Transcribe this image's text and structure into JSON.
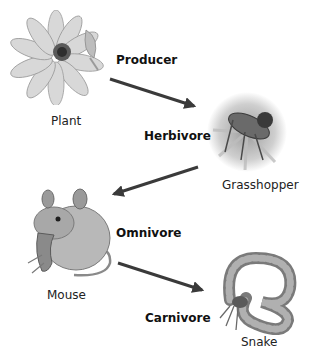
{
  "diagram": {
    "type": "food-chain",
    "nodes": [
      {
        "organism": "Plant",
        "role": "Producer",
        "icon": "flower-icon"
      },
      {
        "organism": "Grasshopper",
        "role": "Herbivore",
        "icon": "grasshopper-icon"
      },
      {
        "organism": "Mouse",
        "role": "Omnivore",
        "icon": "mouse-icon"
      },
      {
        "organism": "Snake",
        "role": "Carnivore",
        "icon": "snake-icon"
      }
    ],
    "edges": [
      {
        "from": "Plant",
        "to": "Grasshopper"
      },
      {
        "from": "Grasshopper",
        "to": "Mouse"
      },
      {
        "from": "Mouse",
        "to": "Snake"
      }
    ],
    "colors": {
      "arrow": "#3a3a3a",
      "text": "#222222",
      "illustration": "#9a9a9a"
    }
  }
}
